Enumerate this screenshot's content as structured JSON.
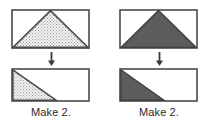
{
  "diagram": {
    "type": "quilt-piecing-units",
    "background_color": "#ffffff",
    "outline_color": "#4a4a4a",
    "dark_fill_color": "#5c5c5c",
    "stipple_fill_color": "#f2f2f2",
    "stipple_dot_color": "#9a9a9a",
    "text_color": "#2b2b2b",
    "arrow_color": "#3a3a3a",
    "arrow_icon_name": "arrow-down-icon"
  },
  "units": [
    {
      "id": "left",
      "fabric_style": "stippled",
      "top_shape": {
        "name": "rectangle-with-centered-triangle",
        "outline": "rectangle",
        "inner_shape": "isosceles-triangle",
        "apex_position_percent": 50,
        "fill": "stipple"
      },
      "arrow": {
        "direction": "down",
        "label": "becomes"
      },
      "bottom_shape": {
        "name": "rectangle-with-half-triangle",
        "outline": "rectangle",
        "inner_shape": "right-triangle",
        "diagonal_from": "top-left",
        "diagonal_to_percent": 57,
        "fill": "stipple"
      },
      "caption": "Make 2."
    },
    {
      "id": "right",
      "fabric_style": "solid-dark",
      "top_shape": {
        "name": "rectangle-with-centered-triangle",
        "outline": "rectangle",
        "inner_shape": "isosceles-triangle",
        "apex_position_percent": 50,
        "fill": "dark"
      },
      "arrow": {
        "direction": "down",
        "label": "becomes"
      },
      "bottom_shape": {
        "name": "rectangle-with-half-triangle",
        "outline": "rectangle",
        "inner_shape": "right-triangle",
        "diagonal_from": "top-left",
        "diagonal_to_percent": 57,
        "fill": "dark"
      },
      "caption": "Make 2."
    }
  ]
}
